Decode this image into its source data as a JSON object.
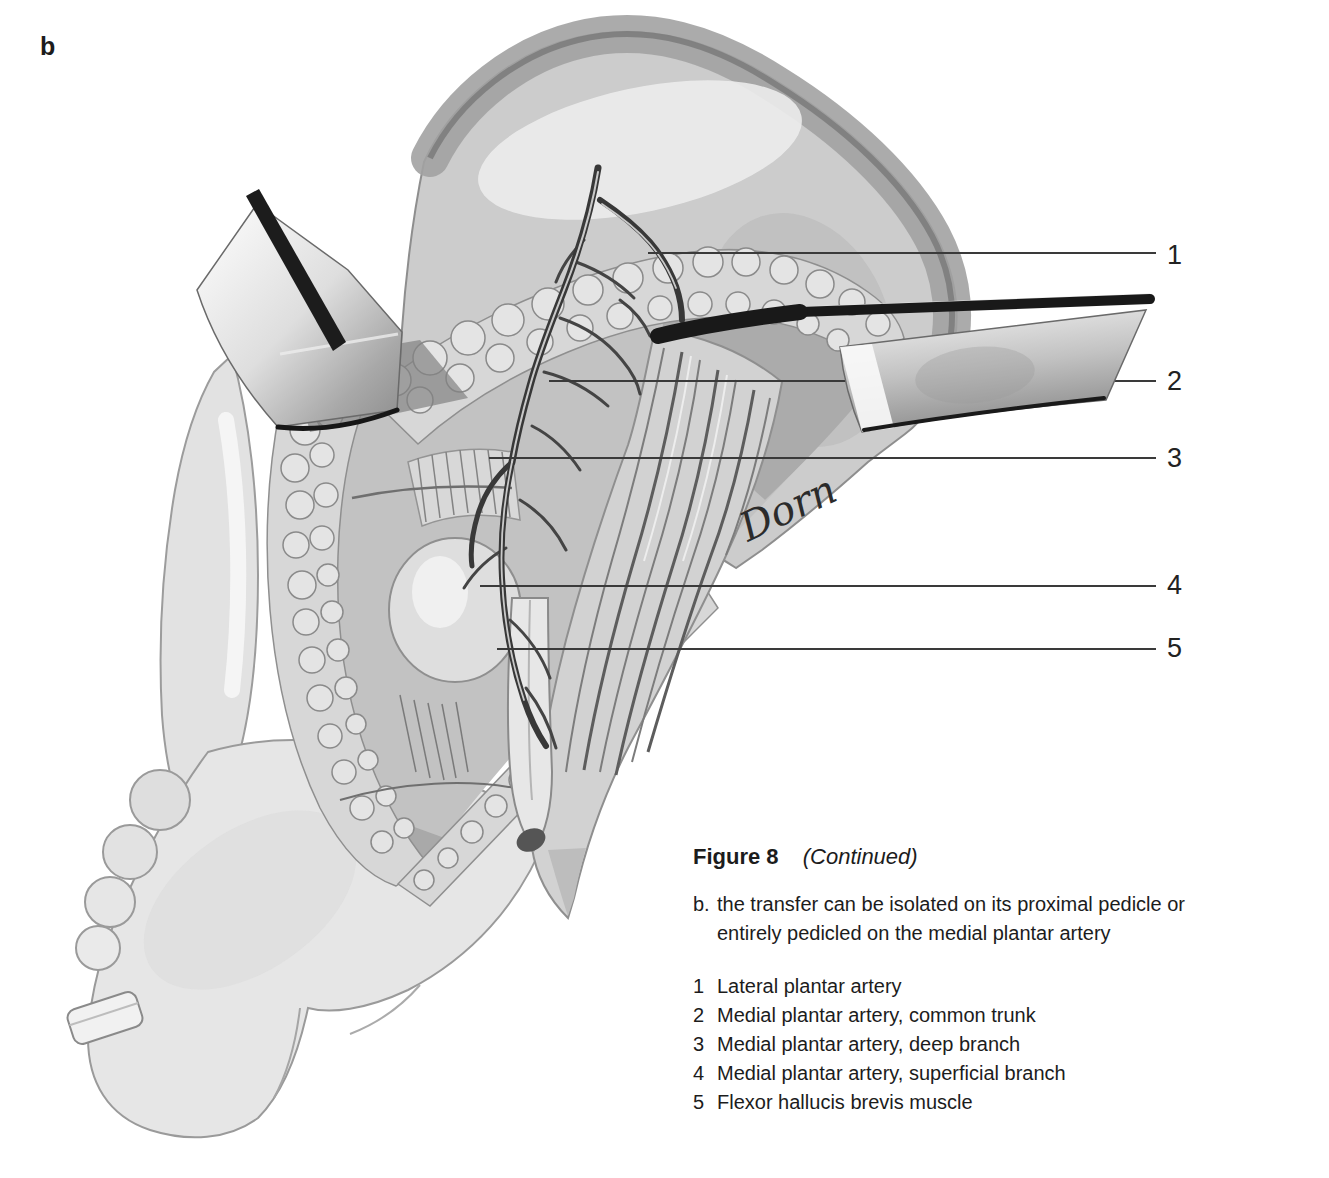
{
  "panel_label": "b",
  "illustration": {
    "artist_signature": "Dorn",
    "callouts": [
      "1",
      "2",
      "3",
      "4",
      "5"
    ]
  },
  "caption": {
    "figure_label": "Figure 8",
    "figure_note": "(Continued)",
    "item_marker": "b.",
    "item_lines": [
      "the transfer can be isolated on its proximal pedicle or",
      "entirely pedicled on the medial plantar artery"
    ],
    "legend": [
      {
        "number": "1",
        "label": "Lateral plantar artery"
      },
      {
        "number": "2",
        "label": "Medial plantar artery, common trunk"
      },
      {
        "number": "3",
        "label": "Medial plantar artery, deep branch"
      },
      {
        "number": "4",
        "label": "Medial plantar artery, superficial branch"
      },
      {
        "number": "5",
        "label": "Flexor hallucis brevis muscle"
      }
    ]
  },
  "colors": {
    "background": "#ffffff",
    "ink": "#1c1c1c",
    "leader_line": "#3a3a3a",
    "drawing_mid_gray": "#c2c2c2",
    "retractor_dark": "#191919"
  }
}
